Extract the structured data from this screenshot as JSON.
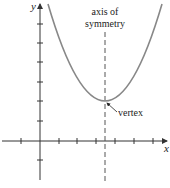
{
  "diagram": {
    "type": "parabola-graph",
    "labels": {
      "y_axis": "y",
      "x_axis": "x",
      "axis_line1": "axis of",
      "axis_line2": "symmetry",
      "vertex": "vertex"
    },
    "colors": {
      "axes": "#333333",
      "curve": "#888888",
      "dashed": "#555555",
      "text": "#222222"
    },
    "vertex_approx": {
      "x": 3.5,
      "y": 2
    },
    "tick_spacing_units": 1,
    "x_ticks": [
      -1,
      1,
      2,
      3,
      4,
      5,
      6
    ],
    "y_ticks": [
      -1,
      1,
      2,
      3,
      4,
      5,
      6
    ]
  }
}
